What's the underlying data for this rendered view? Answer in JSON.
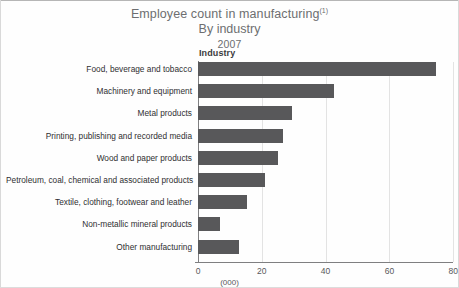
{
  "chart_data": {
    "type": "bar",
    "orientation": "horizontal",
    "title": "Employee count in manufacturing",
    "title_superscript": "(1)",
    "subtitle": "By industry",
    "year": "2007",
    "group_header": "Industry",
    "xlabel": "(000)",
    "ylabel": "",
    "xlim": [
      0,
      80
    ],
    "xticks": [
      0,
      20,
      40,
      60,
      80
    ],
    "xtick_labels": [
      "0",
      "20",
      "40",
      "60",
      "80"
    ],
    "grid": "vertical",
    "legend": "none",
    "bar_color": "#58585a",
    "categories": [
      "Food, beverage and tobacco",
      "Machinery and equipment",
      "Metal products",
      "Printing, publishing and recorded media",
      "Wood and paper products",
      "Petroleum, coal, chemical and associated products",
      "Textile, clothing, footwear and leather",
      "Non-metallic mineral products",
      "Other manufacturing"
    ],
    "values": [
      74.5,
      42.5,
      29.5,
      26.5,
      25.0,
      21.0,
      15.5,
      7.0,
      13.0
    ],
    "units": "thousands"
  },
  "colors": {
    "bar": "#58585a",
    "axis": "#7f7f81",
    "grid": "#e3e3e3",
    "title_text": "#6d6e70",
    "label_text": "#2f2f31",
    "tick_text": "#59595b",
    "background": "#fefefe"
  }
}
